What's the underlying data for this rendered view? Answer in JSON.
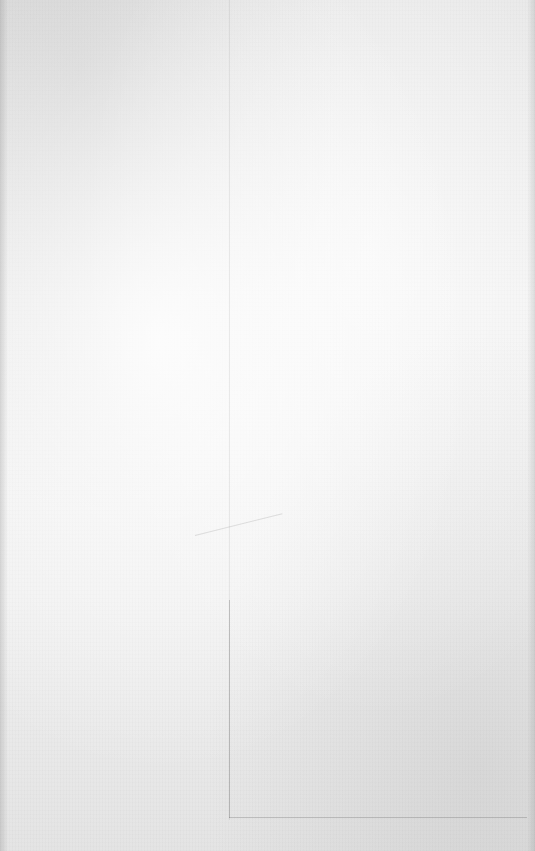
{
  "surface": {
    "type": "blank-paper",
    "base_color": "#ececec",
    "highlight_color": "#f4f4f4",
    "shadow_color": "#d6d6d6"
  }
}
